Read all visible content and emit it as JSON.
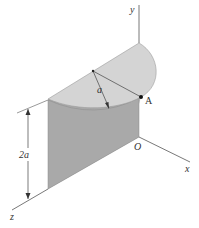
{
  "diagram": {
    "type": "3d-solid-figure",
    "axes": {
      "x_label": "x",
      "y_label": "y",
      "z_label": "z",
      "origin_label": "O"
    },
    "point_label": "A",
    "radius_label": "a",
    "height_label": "2a",
    "colors": {
      "top_face": "#d4d4d4",
      "front_face": "#a9a9a9",
      "curved_face": "#c2c2c2",
      "lines": "#555555",
      "point": "#111111"
    }
  }
}
